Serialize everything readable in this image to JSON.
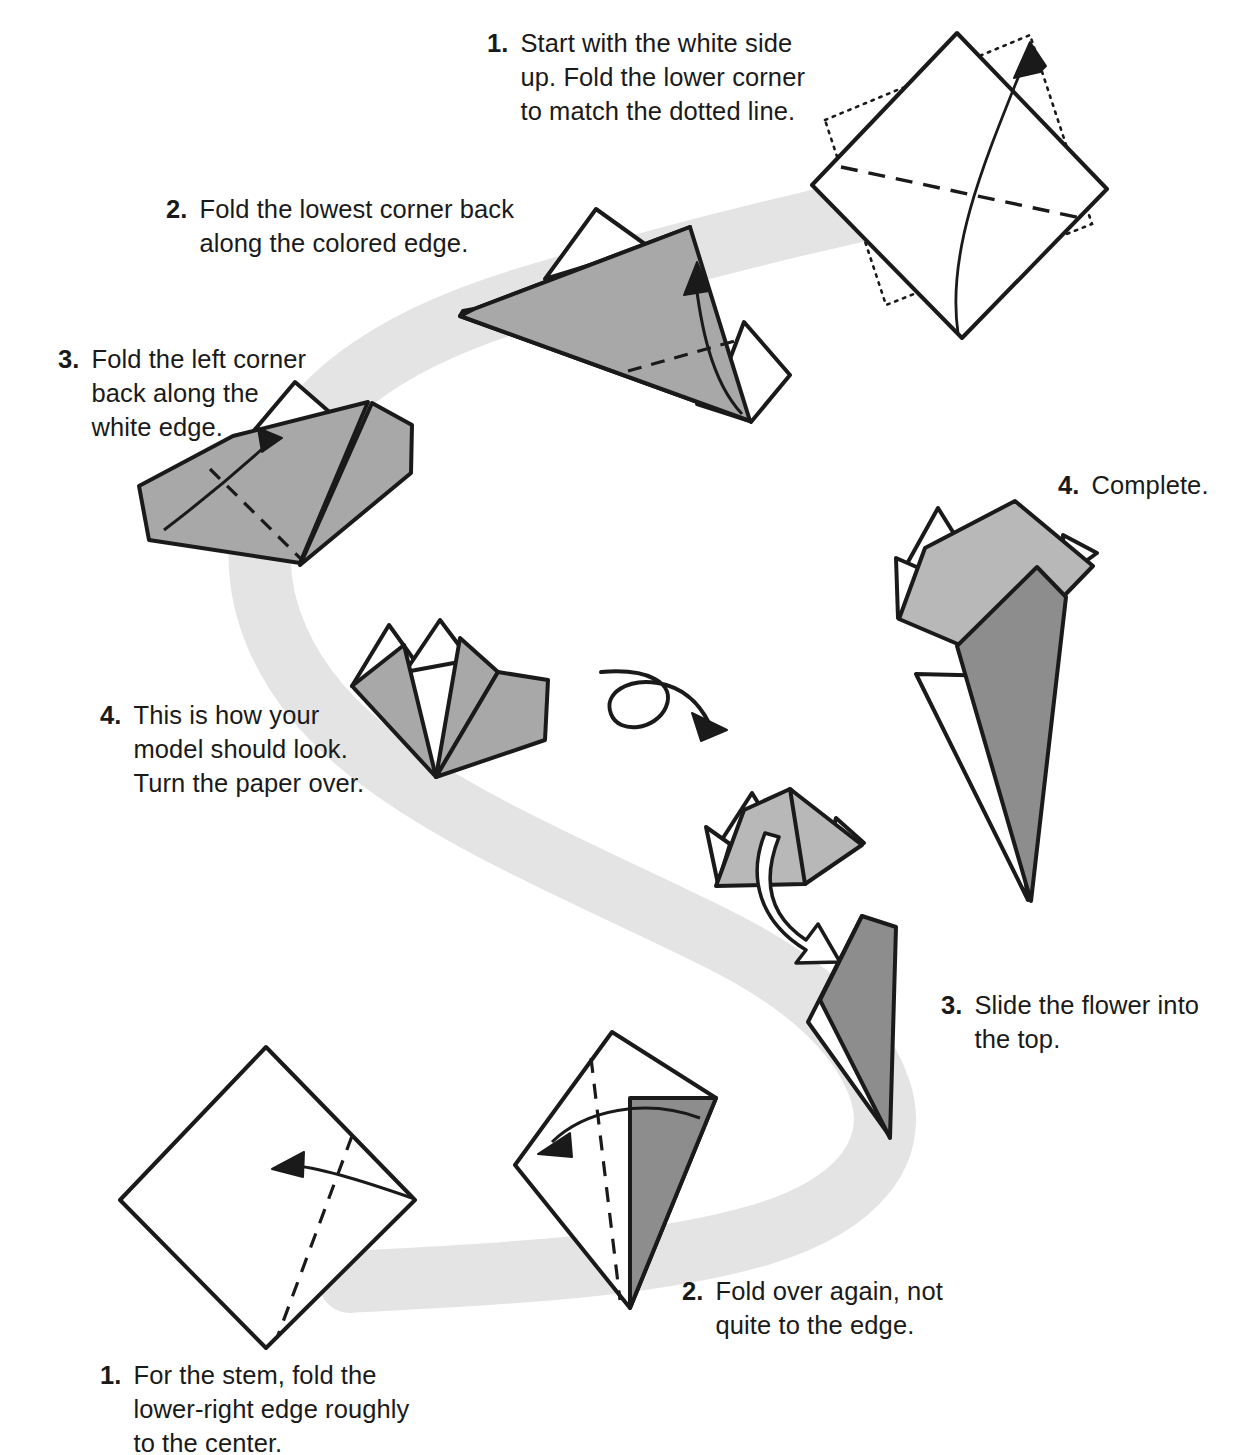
{
  "page": {
    "background_color": "#ffffff",
    "ink_color": "#1a1a1a"
  },
  "palette": {
    "ribbon_gray": "#e4e4e4",
    "paper_white": "#ffffff",
    "paper_light_gray": "#b8b8b8",
    "paper_mid_gray": "#a8a8a8",
    "paper_dark_gray": "#8d8d8d",
    "outline": "#1a1a1a"
  },
  "steps": [
    {
      "id": "step-1-top",
      "number": "1.",
      "text": "Start with the white side up. Fold the lower corner to match the dotted line."
    },
    {
      "id": "step-2-top",
      "number": "2.",
      "text": "Fold the lowest corner back along the colored edge."
    },
    {
      "id": "step-3-left",
      "number": "3.",
      "text": "Fold the left corner back along the white edge."
    },
    {
      "id": "step-4-complete",
      "number": "4.",
      "text": "Complete."
    },
    {
      "id": "step-4-turnover",
      "number": "4.",
      "text": "This is how your model should look. Turn the paper over."
    },
    {
      "id": "step-3-slide",
      "number": "3.",
      "text": "Slide the flower into the top."
    },
    {
      "id": "step-2-stem",
      "number": "2.",
      "text": "Fold over again, not quite to the edge."
    },
    {
      "id": "step-1-stem",
      "number": "1.",
      "text": "For the stem, fold the lower-right edge roughly to the center."
    }
  ],
  "figures": [
    {
      "id": "figure-square-start",
      "label": "white square with dotted target outline and valley fold"
    },
    {
      "id": "figure-folded-2",
      "label": "gray folded paper with white flaps and fold arrow"
    },
    {
      "id": "figure-folded-3",
      "label": "gray folded paper with left corner fold arrow"
    },
    {
      "id": "figure-flower-model",
      "label": "finished gray flower model seen from front"
    },
    {
      "id": "figure-turn-over-arrow",
      "label": "loop arrow indicating turn the paper over"
    },
    {
      "id": "figure-flower-small",
      "label": "small gray flower being joined to the stem"
    },
    {
      "id": "figure-insert-arrow",
      "label": "hollow white arrow showing insertion direction"
    },
    {
      "id": "figure-stem-cone",
      "label": "dark gray folded stem cone"
    },
    {
      "id": "figure-complete",
      "label": "completed flower with stem"
    },
    {
      "id": "figure-stem-square",
      "label": "white square with dashed fold line and fold arrow"
    },
    {
      "id": "figure-stem-folded",
      "label": "white square with dark gray folded flap and fold arrow"
    },
    {
      "id": "figure-ribbon",
      "label": "light gray S-shaped flow ribbon connecting the steps"
    }
  ]
}
